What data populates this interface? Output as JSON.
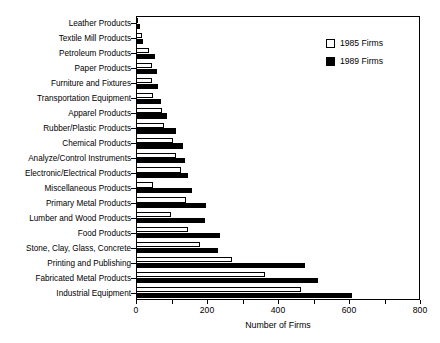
{
  "chart_data": {
    "type": "bar",
    "orientation": "horizontal",
    "title": "",
    "xlabel": "Number of Firms",
    "ylabel": "",
    "xlim": [
      0,
      800
    ],
    "xticks": [
      0,
      100,
      200,
      300,
      400,
      500,
      600,
      700,
      800
    ],
    "xtick_labels": [
      "0",
      "",
      "200",
      "",
      "400",
      "",
      "600",
      "",
      "800"
    ],
    "grid": false,
    "legend_position": "top-right",
    "categories": [
      "Leather Products",
      "Textile Mill Products",
      "Petroleum Products",
      "Paper Products",
      "Furniture and Fixtures",
      "Transportation Equipment",
      "Apparel Products",
      "Rubber/Plastic Products",
      "Chemical Products",
      "Analyze/Control Instruments",
      "Electronic/Electrical Products",
      "Miscellaneous Products",
      "Primary Metal Products",
      "Lumber and Wood Products",
      "Food Products",
      "Stone, Clay, Glass, Concrete",
      "Printing and Publishing",
      "Fabricated Metal Products",
      "Industrial Equipment"
    ],
    "series": [
      {
        "name": "1985 Firms",
        "color": "#ffffff",
        "edgecolor": "#000000",
        "values": [
          6,
          18,
          37,
          45,
          45,
          48,
          73,
          78,
          104,
          112,
          126,
          47,
          142,
          98,
          147,
          181,
          270,
          362,
          466
        ]
      },
      {
        "name": "1989 Firms",
        "color": "#000000",
        "edgecolor": "#000000",
        "values": [
          10,
          20,
          53,
          60,
          62,
          70,
          88,
          113,
          132,
          139,
          146,
          157,
          196,
          194,
          238,
          230,
          476,
          513,
          608
        ]
      }
    ]
  },
  "legend": {
    "entries": [
      {
        "label": "1985 Firms",
        "swatch": "white"
      },
      {
        "label": "1989 Firms",
        "swatch": "black"
      }
    ]
  },
  "axis": {
    "x_title": "Number of Firms"
  }
}
